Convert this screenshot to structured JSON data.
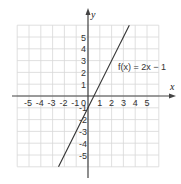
{
  "chart_data": {
    "type": "line",
    "title": "",
    "xlabel": "x",
    "ylabel": "y",
    "xlim": [
      -6,
      6
    ],
    "ylim": [
      -6,
      6
    ],
    "grid": true,
    "x_ticks": [
      -5,
      -4,
      -3,
      -2,
      -1,
      0,
      1,
      2,
      3,
      4,
      5
    ],
    "y_ticks": [
      -5,
      -4,
      -3,
      -2,
      -1,
      1,
      2,
      3,
      4,
      5
    ],
    "series": [
      {
        "name": "f(x) = 2x − 1",
        "equation": "f(x) = 2x - 1",
        "slope": 2,
        "intercept": -1,
        "x": [
          -2.5,
          3.5
        ],
        "y": [
          -6,
          6
        ]
      }
    ],
    "annotations": [
      {
        "text": "f(x) = 2x − 1",
        "x": 2.4,
        "y": 2.3
      }
    ]
  },
  "labels": {
    "x_axis": "x",
    "y_axis": "y",
    "equation": "f(x) = 2x − 1",
    "x_ticks": [
      "-5",
      "-4",
      "-3",
      "-2",
      "-1",
      "0",
      "1",
      "2",
      "3",
      "4",
      "5"
    ],
    "y_ticks_pos": [
      "1",
      "2",
      "3",
      "4",
      "5"
    ],
    "y_ticks_neg": [
      "-1",
      "-2",
      "-3",
      "-4",
      "-5"
    ]
  },
  "colors": {
    "grid": "#d8d8d8",
    "axis": "#444444",
    "line": "#333333"
  }
}
